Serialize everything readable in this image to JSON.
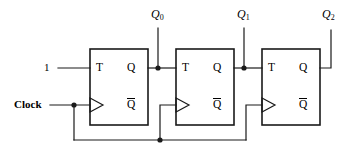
{
  "diagram": {
    "type": "logic-circuit-schematic",
    "line_color": "#1a1a1a",
    "background_color": "#ffffff",
    "inputs": [
      {
        "id": "t-input",
        "label": "1",
        "x": 47,
        "y": 68
      },
      {
        "id": "clock-input",
        "label": "Clock",
        "x": 18,
        "y": 105
      }
    ],
    "outputs": [
      {
        "id": "q0-output",
        "label": "Q",
        "sub": "0",
        "x": 155,
        "y": 16
      },
      {
        "id": "q1-output",
        "label": "Q",
        "sub": "1",
        "x": 240,
        "y": 16
      },
      {
        "id": "q2-output",
        "label": "Q",
        "sub": "2",
        "x": 325,
        "y": 16
      }
    ],
    "flipflops": [
      {
        "id": "flipflop-0",
        "name": "T flip-flop 0",
        "x": 90,
        "y": 49,
        "w": 58,
        "h": 76,
        "pins": {
          "t": "T",
          "q": "Q",
          "qbar": "Q"
        }
      },
      {
        "id": "flipflop-1",
        "name": "T flip-flop 1",
        "x": 176,
        "y": 49,
        "w": 58,
        "h": 76,
        "pins": {
          "t": "T",
          "q": "Q",
          "qbar": "Q"
        }
      },
      {
        "id": "flipflop-2",
        "name": "T flip-flop 2",
        "x": 262,
        "y": 49,
        "w": 58,
        "h": 76,
        "pins": {
          "t": "T",
          "q": "Q",
          "qbar": "Q"
        }
      }
    ],
    "junctions": [
      {
        "id": "junction-clock-tap",
        "x": 74,
        "y": 105
      },
      {
        "id": "junction-q0-tap",
        "x": 158,
        "y": 68
      },
      {
        "id": "junction-q1-tap",
        "x": 244,
        "y": 68
      },
      {
        "id": "junction-clock-bus",
        "x": 160,
        "y": 140
      }
    ]
  }
}
